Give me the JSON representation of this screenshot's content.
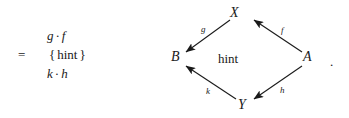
{
  "proof_step": {
    "lines": [
      {
        "relation": "",
        "expr_left": "g",
        "operator": "·",
        "expr_right": "f",
        "type": "expression"
      },
      {
        "relation": "=",
        "open_brace": "{",
        "hint": "hint",
        "close_brace": "}",
        "type": "hint"
      },
      {
        "relation": "",
        "expr_left": "k",
        "operator": "·",
        "expr_right": "h",
        "type": "expression"
      }
    ]
  },
  "diagram": {
    "type": "commutative-diamond",
    "center_label": "hint",
    "nodes": [
      {
        "id": "X",
        "label": "X",
        "position": "top"
      },
      {
        "id": "B",
        "label": "B",
        "position": "left"
      },
      {
        "id": "A",
        "label": "A",
        "position": "right"
      },
      {
        "id": "Y",
        "label": "Y",
        "position": "bottom"
      }
    ],
    "edges": [
      {
        "id": "g",
        "label": "g",
        "from": "X",
        "to": "B",
        "direction": "down-left"
      },
      {
        "id": "f",
        "label": "f",
        "from": "A",
        "to": "X",
        "direction": "up-left"
      },
      {
        "id": "k",
        "label": "k",
        "from": "Y",
        "to": "B",
        "direction": "up-left"
      },
      {
        "id": "h",
        "label": "h",
        "from": "A",
        "to": "Y",
        "direction": "down-left"
      }
    ],
    "trailing_punctuation": "."
  },
  "colors": {
    "ink": "#1a1a1a",
    "background": "#ffffff"
  }
}
